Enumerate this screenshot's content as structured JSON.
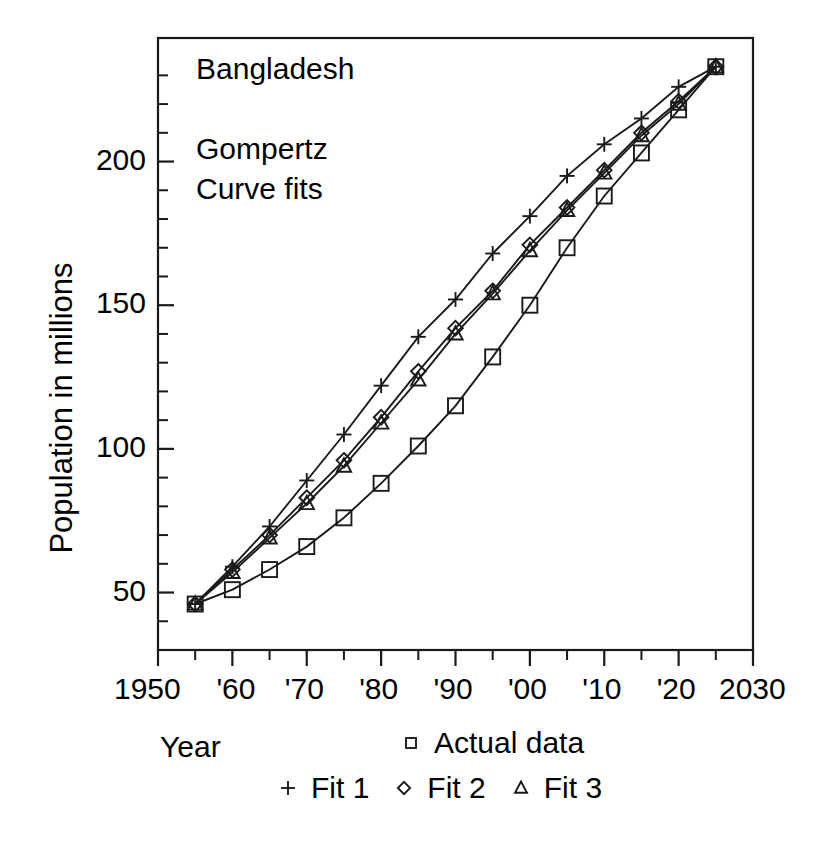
{
  "chart_data": {
    "type": "line",
    "title": "Bangladesh",
    "subtitle_line1": "Gompertz",
    "subtitle_line2": "Curve fits",
    "xlabel": "Year",
    "ylabel": "Population in millions",
    "xlim": [
      1950,
      2030
    ],
    "ylim": [
      30,
      243
    ],
    "grid": false,
    "legend_position": "below-axis",
    "x_tick_labels": [
      "1950",
      "'60",
      "'70",
      "'80",
      "'90",
      "'00",
      "'10",
      "'20",
      "2030"
    ],
    "x_tick_values": [
      1950,
      1960,
      1970,
      1980,
      1990,
      2000,
      2010,
      2020,
      2030
    ],
    "x_minor_tick_values": [
      1955,
      1965,
      1975,
      1985,
      1995,
      2005,
      2015,
      2025
    ],
    "y_tick_labels": [
      "50",
      "100",
      "150",
      "200"
    ],
    "y_tick_values": [
      50,
      100,
      150,
      200
    ],
    "y_minor_tick_values": [
      40,
      60,
      70,
      80,
      90,
      110,
      120,
      130,
      140,
      160,
      170,
      180,
      190,
      210,
      220,
      230
    ],
    "x": [
      1955,
      1960,
      1965,
      1970,
      1975,
      1980,
      1985,
      1990,
      1995,
      2000,
      2005,
      2010,
      2015,
      2020,
      2025
    ],
    "series": [
      {
        "name": "Actual data",
        "marker": "square",
        "values": [
          46,
          51,
          58,
          66,
          76,
          88,
          101,
          115,
          132,
          150,
          170,
          188,
          203,
          218,
          233
        ]
      },
      {
        "name": "Fit 1",
        "marker": "plus",
        "values": [
          46,
          59,
          73,
          89,
          105,
          122,
          139,
          152,
          168,
          181,
          195,
          206,
          215,
          226,
          233
        ]
      },
      {
        "name": "Fit 2",
        "marker": "diamond",
        "values": [
          46,
          58,
          70,
          83,
          96,
          111,
          127,
          142,
          155,
          171,
          184,
          197,
          210,
          221,
          233
        ]
      },
      {
        "name": "Fit 3",
        "marker": "triangle",
        "values": [
          46,
          57,
          69,
          81,
          94,
          109,
          124,
          140,
          154,
          169,
          183,
          196,
          209,
          220,
          233
        ]
      }
    ]
  },
  "legend": {
    "row1": [
      {
        "marker": "square",
        "label": "Actual data"
      }
    ],
    "row2": [
      {
        "marker": "plus",
        "label": "Fit 1"
      },
      {
        "marker": "diamond",
        "label": "Fit 2"
      },
      {
        "marker": "triangle",
        "label": "Fit 3"
      }
    ]
  },
  "colors": {
    "ink": "#1a1a1a",
    "background": "#ffffff"
  }
}
